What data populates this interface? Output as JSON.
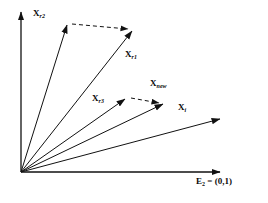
{
  "figure": {
    "type": "vector-diagram",
    "background_color": "#ffffff",
    "stroke_color": "#111111",
    "axes": {
      "origin": [
        21,
        172
      ],
      "vertical_axis": {
        "name": "vertical-axis",
        "from": [
          21,
          172
        ],
        "to": [
          21,
          10
        ],
        "arrow": true
      },
      "horizontal_axis": {
        "name": "horizontal-axis",
        "from": [
          21,
          172
        ],
        "to": [
          222,
          172
        ],
        "arrow": true
      },
      "horizontal_axis_label": {
        "text": "E",
        "subscript": "2",
        "equals": " = (0,1)",
        "full_text": "E2 = (0,1)",
        "x": 196,
        "y": 180
      }
    },
    "vectors": [
      {
        "id": "x-r2",
        "label": "X",
        "subscript": "r2",
        "from": [
          21,
          172
        ],
        "to": [
          68,
          22
        ],
        "style": "solid",
        "label_x": 33,
        "label_y": 13
      },
      {
        "id": "x-r1",
        "label": "X",
        "subscript": "r1",
        "from": [
          21,
          172
        ],
        "to": [
          134,
          28
        ],
        "style": "solid",
        "label_x": 125,
        "label_y": 54
      },
      {
        "id": "x-r3",
        "label": "X",
        "subscript": "r3",
        "from": [
          21,
          172
        ],
        "to": [
          127,
          97
        ],
        "style": "solid",
        "label_x": 93,
        "label_y": 98
      },
      {
        "id": "x-new",
        "label": "X",
        "subscript": "new",
        "from": [
          21,
          172
        ],
        "to": [
          165,
          103
        ],
        "style": "solid",
        "label_x": 151,
        "label_y": 83
      },
      {
        "id": "x-i",
        "label": "X",
        "subscript": "i",
        "from": [
          21,
          172
        ],
        "to": [
          222,
          118
        ],
        "style": "solid",
        "label_x": 178,
        "label_y": 107
      }
    ],
    "difference_vectors": [
      {
        "id": "diff-r2-r1",
        "from": [
          71,
          24
        ],
        "to": [
          131,
          29
        ],
        "style": "dashed",
        "dash_pattern": "4,3"
      },
      {
        "id": "diff-r3-new",
        "from": [
          130,
          98
        ],
        "to": [
          162,
          103
        ],
        "style": "dashed",
        "dash_pattern": "4,3"
      }
    ]
  }
}
